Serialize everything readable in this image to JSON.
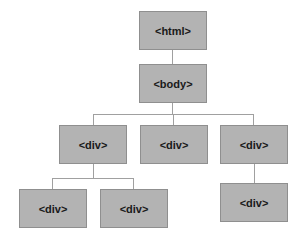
{
  "diagram": {
    "title": "",
    "nodes": [
      {
        "id": "html",
        "label": "<html>",
        "x": 139,
        "y": 11,
        "w": 68,
        "h": 39
      },
      {
        "id": "body",
        "label": "<body>",
        "x": 139,
        "y": 64,
        "w": 68,
        "h": 39
      },
      {
        "id": "div1",
        "label": "<div>",
        "x": 59,
        "y": 125,
        "w": 68,
        "h": 39
      },
      {
        "id": "div2",
        "label": "<div>",
        "x": 140,
        "y": 125,
        "w": 68,
        "h": 39
      },
      {
        "id": "div3",
        "label": "<div>",
        "x": 220,
        "y": 125,
        "w": 68,
        "h": 39
      },
      {
        "id": "div1a",
        "label": "<div>",
        "x": 19,
        "y": 189,
        "w": 68,
        "h": 39
      },
      {
        "id": "div1b",
        "label": "<div>",
        "x": 100,
        "y": 189,
        "w": 68,
        "h": 39
      },
      {
        "id": "div3a",
        "label": "<div>",
        "x": 220,
        "y": 183,
        "w": 68,
        "h": 39
      }
    ],
    "edges": [
      {
        "from": "html",
        "to": "body"
      },
      {
        "from": "body",
        "to": "div1"
      },
      {
        "from": "body",
        "to": "div2"
      },
      {
        "from": "body",
        "to": "div3"
      },
      {
        "from": "div1",
        "to": "div1a"
      },
      {
        "from": "div1",
        "to": "div1b"
      },
      {
        "from": "div3",
        "to": "div3a"
      }
    ],
    "colors": {
      "node_fill": "#b3b3b3",
      "node_border": "#8f8f8f",
      "connector": "#a0a0a0",
      "text": "#1a1a1a"
    }
  }
}
